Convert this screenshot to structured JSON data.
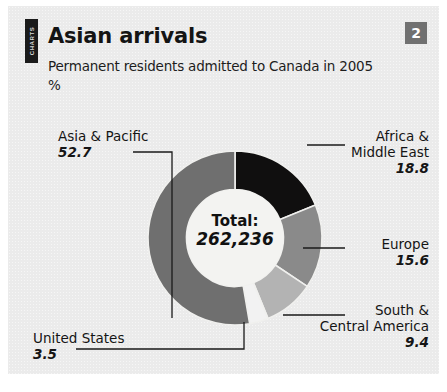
{
  "header": {
    "side_rule_text": "CHARTS",
    "title": "Asian arrivals",
    "subtitle": "Permanent residents admitted to Canada in 2005",
    "unit": "%",
    "badge": "2"
  },
  "center": {
    "total_label": "Total:",
    "total_value": "262,236"
  },
  "chart_data": {
    "type": "pie",
    "title": "Asian arrivals",
    "subtitle": "Permanent residents admitted to Canada in 2005",
    "ylabel": "%",
    "unit": "%",
    "total_label": "Total:",
    "total_value": "262,236",
    "total_numeric": 262236,
    "donut": true,
    "inner_radius_ratio": 0.52,
    "start_angle_deg": 0,
    "direction": "clockwise",
    "legend": "callouts",
    "categories": [
      "Africa & Middle East",
      "Europe",
      "South & Central America",
      "United States",
      "Asia & Pacific"
    ],
    "values": [
      18.8,
      15.6,
      9.4,
      3.5,
      52.7
    ],
    "colors": [
      "#100f0f",
      "#8a8a8a",
      "#b3b3b3",
      "#f2f2f2",
      "#6f6f6f"
    ],
    "slices": [
      {
        "label": "Africa & Middle East",
        "label_line1": "Africa &",
        "label_line2": "Middle East",
        "value": 18.8,
        "value_text": "18.8",
        "color": "#100f0f",
        "callout_side": "right"
      },
      {
        "label": "Europe",
        "label_line1": "Europe",
        "label_line2": "",
        "value": 15.6,
        "value_text": "15.6",
        "color": "#8a8a8a",
        "callout_side": "right"
      },
      {
        "label": "South & Central America",
        "label_line1": "South &",
        "label_line2": "Central America",
        "value": 9.4,
        "value_text": "9.4",
        "color": "#b3b3b3",
        "callout_side": "right"
      },
      {
        "label": "United States",
        "label_line1": "United States",
        "label_line2": "",
        "value": 3.5,
        "value_text": "3.5",
        "color": "#f2f2f2",
        "callout_side": "left"
      },
      {
        "label": "Asia & Pacific",
        "label_line1": "Asia & Pacific",
        "label_line2": "",
        "value": 52.7,
        "value_text": "52.7",
        "color": "#6f6f6f",
        "callout_side": "left"
      }
    ]
  }
}
